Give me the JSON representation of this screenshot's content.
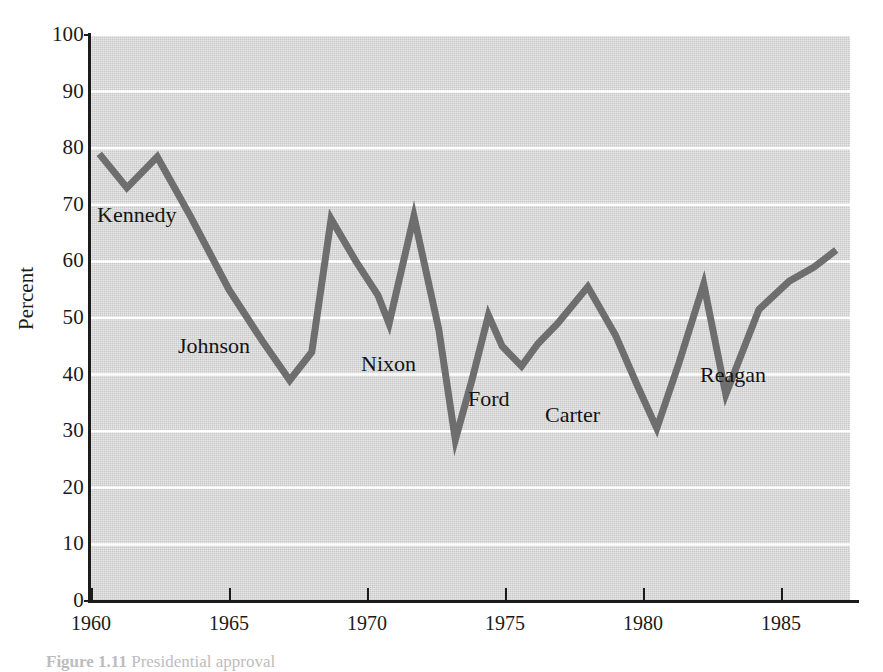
{
  "figure": {
    "ylabel": "Percent",
    "caption_label": "Figure 1.11",
    "caption_text": "Presidential approval"
  },
  "colors": {
    "plot_background": "#c9c9c9",
    "line": "#6e6e6e",
    "gridline": "#ffffff",
    "axis": "#1b1b1b",
    "text": "#141414"
  },
  "annotations": [
    {
      "label": "Kennedy",
      "x_px": 97,
      "y_px": 203
    },
    {
      "label": "Johnson",
      "x_px": 178,
      "y_px": 334
    },
    {
      "label": "Nixon",
      "x_px": 361,
      "y_px": 352
    },
    {
      "label": "Ford",
      "x_px": 468,
      "y_px": 387
    },
    {
      "label": "Carter",
      "x_px": 545,
      "y_px": 403
    },
    {
      "label": "Reagan",
      "x_px": 700,
      "y_px": 363
    }
  ],
  "chart_data": {
    "type": "line",
    "title": "",
    "subtitle": "",
    "xlabel": "",
    "ylabel": "Percent",
    "xlim": [
      1960,
      1987.5
    ],
    "ylim": [
      0,
      100
    ],
    "grid": true,
    "grid_axis": "y",
    "legend": false,
    "legend_position": "none",
    "x_ticks": [
      1960,
      1965,
      1970,
      1975,
      1980,
      1985
    ],
    "x_tick_labels": [
      "1960",
      "1965",
      "1970",
      "1975",
      "1980",
      "1985"
    ],
    "y_ticks": [
      0,
      10,
      20,
      30,
      40,
      50,
      60,
      70,
      80,
      90,
      100
    ],
    "y_tick_labels": [
      "0",
      "10",
      "20",
      "30",
      "40",
      "50",
      "60",
      "70",
      "80",
      "90",
      "100"
    ],
    "series": [
      {
        "name": "Presidential approval",
        "color": "#6e6e6e",
        "x": [
          1960.3,
          1961.3,
          1962.4,
          1963.6,
          1965.0,
          1966.2,
          1967.2,
          1968.0,
          1968.7,
          1969.6,
          1970.4,
          1970.8,
          1971.7,
          1972.6,
          1973.2,
          1973.8,
          1974.4,
          1974.9,
          1975.6,
          1976.2,
          1976.9,
          1978.0,
          1979.0,
          1979.8,
          1980.5,
          1981.3,
          1982.2,
          1983.0,
          1984.2,
          1985.3,
          1986.2,
          1987.0
        ],
        "y": [
          79.0,
          73.0,
          78.5,
          68.0,
          55.0,
          46.0,
          39.0,
          44.0,
          67.5,
          60.0,
          54.0,
          49.0,
          68.0,
          48.0,
          28.5,
          39.0,
          50.5,
          45.0,
          41.5,
          45.5,
          49.0,
          55.5,
          47.0,
          38.0,
          30.5,
          42.0,
          56.0,
          36.5,
          51.5,
          56.5,
          59.0,
          62.0
        ]
      }
    ],
    "notable_points": [
      {
        "label": "Kennedy start",
        "x": 1960.3,
        "y": 79.0
      },
      {
        "label": "Johnson low",
        "x": 1967.2,
        "y": 39.0
      },
      {
        "label": "Nixon 1968 peak",
        "x": 1968.7,
        "y": 67.5
      },
      {
        "label": "Nixon 1971 peak",
        "x": 1971.7,
        "y": 68.0
      },
      {
        "label": "Watergate low",
        "x": 1973.2,
        "y": 28.5
      },
      {
        "label": "Carter low",
        "x": 1980.5,
        "y": 30.5
      },
      {
        "label": "Reagan peak",
        "x": 1982.2,
        "y": 56.0
      },
      {
        "label": "Reagan low",
        "x": 1983.0,
        "y": 36.5
      },
      {
        "label": "Reagan end",
        "x": 1987.0,
        "y": 62.0
      }
    ]
  }
}
